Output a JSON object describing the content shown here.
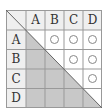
{
  "table": {
    "columns": [
      "A",
      "B",
      "C",
      "D"
    ],
    "rows": [
      "A",
      "B",
      "C",
      "D"
    ],
    "cells": [
      [
        "",
        "○",
        "○",
        "○"
      ],
      [
        "",
        "",
        "○",
        "○"
      ],
      [
        "",
        "",
        "",
        "○"
      ],
      [
        "",
        "",
        "",
        ""
      ]
    ],
    "mark_symbol": "○"
  },
  "colors": {
    "header_bg": "#efefef",
    "shaded_bg": "#c8c8c8",
    "grid_line": "#999999",
    "text": "#333333"
  }
}
